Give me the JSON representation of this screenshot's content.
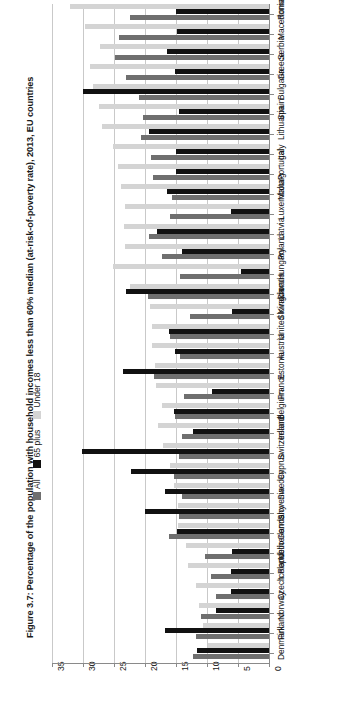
{
  "figure": {
    "title": "Figure 3.7: Percentage of the population with household incomes less than 60% median (at-risk-of-poverty rate), 2013, EU countries"
  },
  "legend": {
    "items": [
      {
        "label": "All",
        "color": "#6f6f6f",
        "key": "all"
      },
      {
        "label": "65 plus",
        "color": "#111111",
        "key": "p65"
      },
      {
        "label": "Under 18",
        "color": "#d4d4d4",
        "key": "u18"
      }
    ]
  },
  "axis": {
    "ticks": [
      "35",
      "30",
      "25",
      "20",
      "15",
      "10",
      "5",
      "0"
    ],
    "tick_values": [
      35,
      30,
      25,
      20,
      15,
      10,
      5,
      0
    ],
    "reversed": true,
    "min": 0,
    "max": 35
  },
  "chart_data": {
    "type": "bar",
    "orientation": "horizontal",
    "title": "Figure 3.7: Percentage of the population with household incomes less than 60% median (at-risk-of-poverty rate), 2013, EU countries",
    "xlabel": "",
    "ylabel": "",
    "xlim": [
      35,
      0
    ],
    "x_reversed": true,
    "grid": true,
    "legend_position": "left-rotated",
    "categories": [
      "Romania",
      "Macedonia",
      "Serbia",
      "Greece",
      "Bulgaria",
      "Spain",
      "Lithuania",
      "Italy",
      "Portugal",
      "Malta",
      "Luxembourg",
      "Latvia",
      "Poland",
      "Hungary",
      "Croatia",
      "Slovakia",
      "United Kingdom",
      "Austria",
      "Estonia",
      "France",
      "Belgium",
      "Ireland",
      "Switzerland",
      "Cyprus",
      "Sweden",
      "Slovenia",
      "Germany",
      "Netherlands",
      "Iceland",
      "Czech Republic",
      "Norway",
      "Finland",
      "Denmark"
    ],
    "series": [
      {
        "name": "Under 18",
        "color": "#d4d4d4",
        "values": [
          32.1,
          29.6,
          27.2,
          28.8,
          28.4,
          27.5,
          26.9,
          25.1,
          24.4,
          23.9,
          23.3,
          23.4,
          23.2,
          25.1,
          22.4,
          19.2,
          18.9,
          18.8,
          18.4,
          18.2,
          17.2,
          17.9,
          17.1,
          15.9,
          15.4,
          14.7,
          14.6,
          13.4,
          13.1,
          11.7,
          11.3,
          10.6,
          9.9
        ]
      },
      {
        "name": "All",
        "color": "#6f6f6f",
        "values": [
          22.4,
          24.2,
          24.8,
          23.1,
          21.0,
          20.4,
          20.6,
          19.1,
          18.7,
          15.7,
          15.9,
          19.4,
          17.3,
          14.3,
          19.5,
          12.8,
          15.9,
          14.4,
          18.6,
          13.7,
          15.1,
          14.1,
          14.5,
          15.3,
          14.1,
          14.5,
          16.1,
          10.4,
          9.3,
          8.6,
          10.9,
          11.8,
          12.3
        ]
      },
      {
        "name": "65 plus",
        "color": "#111111",
        "values": [
          15.0,
          14.9,
          16.5,
          15.1,
          30.0,
          14.5,
          19.4,
          15.0,
          15.0,
          16.4,
          6.2,
          18.0,
          14.1,
          4.5,
          23.0,
          6.0,
          16.2,
          15.2,
          23.5,
          9.2,
          15.4,
          12.3,
          30.1,
          22.3,
          16.8,
          20.0,
          14.9,
          6.0,
          6.2,
          6.2,
          8.5,
          16.8,
          11.6
        ]
      }
    ]
  }
}
